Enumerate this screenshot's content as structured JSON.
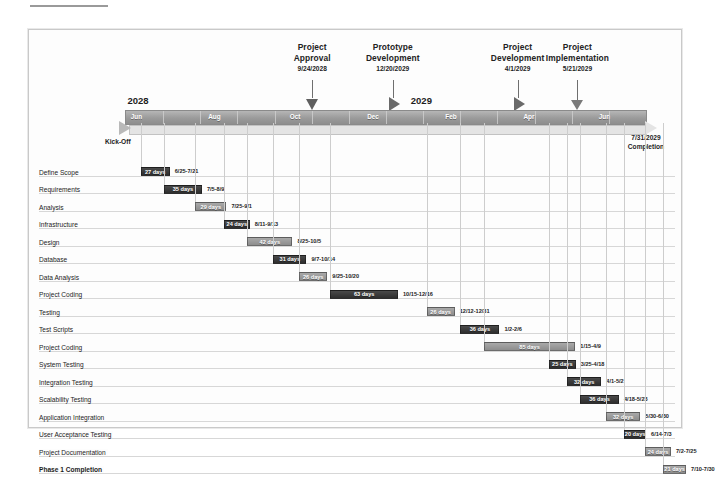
{
  "chart_data": {
    "type": "bar",
    "xlabel": "",
    "ylabel": "",
    "years": [
      {
        "label": "2028",
        "x_pct": 2.0
      },
      {
        "label": "2029",
        "x_pct": 56.5
      }
    ],
    "axis_months": [
      "Jun",
      "Aug",
      "Oct",
      "Dec",
      "Feb",
      "Apr",
      "Jun"
    ],
    "axis_month_positions": [
      2.0,
      17.0,
      32.5,
      47.5,
      62.5,
      77.5,
      92.0
    ],
    "kickoff_label": "Kick-Off",
    "completion": {
      "date": "7/31/2029",
      "label": "Completion"
    },
    "milestones": [
      {
        "title": "Project\nApproval",
        "title_line1": "Project",
        "title_line2": "Approval",
        "date": "9/24/2028",
        "marker": "triangle",
        "x_pct": 36.0
      },
      {
        "title": "Prototype\nDevelopment",
        "title_line1": "Prototype",
        "title_line2": "Development",
        "date": "12/20/2029",
        "marker": "chevron",
        "x_pct": 51.5
      },
      {
        "title": "Project\nDevelopment",
        "title_line1": "Project",
        "title_line2": "Development",
        "date": "4/1/2029",
        "marker": "chevron",
        "x_pct": 75.5
      },
      {
        "title": "Project\nImplementation",
        "title_line1": "Project",
        "title_line2": "Implementation",
        "date": "5/21/2029",
        "marker": "arrow",
        "x_pct": 87.0
      }
    ],
    "categories": [
      "Define Scope",
      "Requirements",
      "Analysis",
      "Infrastructure",
      "Design",
      "Database",
      "Data Analysis",
      "Project Coding",
      "Testing",
      "Test Scripts",
      "Project Coding",
      "System Testing",
      "Integration Testing",
      "Scalability Testing",
      "Application Integration",
      "User Acceptance Testing",
      "Project Documentation",
      "Phase 1 Completion"
    ],
    "values": [
      27,
      35,
      29,
      24,
      42,
      31,
      26,
      63,
      26,
      36,
      85,
      25,
      32,
      36,
      32,
      20,
      24,
      21
    ],
    "tasks": [
      {
        "name": "Define Scope",
        "duration": "27 days",
        "dates": "6/25-7/21",
        "start_pct": 3.0,
        "width_pct": 5.6,
        "color": "dark",
        "bold": false
      },
      {
        "name": "Requirements",
        "duration": "35 days",
        "dates": "7/5-8/9",
        "start_pct": 7.5,
        "width_pct": 7.3,
        "color": "dark",
        "bold": false
      },
      {
        "name": "Analysis",
        "duration": "29 days",
        "dates": "7/25-9/1",
        "start_pct": 13.5,
        "width_pct": 6.0,
        "color": "gray",
        "bold": false
      },
      {
        "name": "Infrastructure",
        "duration": "24 days",
        "dates": "8/11-9/13",
        "start_pct": 19.0,
        "width_pct": 5.0,
        "color": "dark",
        "bold": false
      },
      {
        "name": "Design",
        "duration": "42 days",
        "dates": "8/25-10/5",
        "start_pct": 23.5,
        "width_pct": 8.7,
        "color": "gray",
        "bold": false
      },
      {
        "name": "Database",
        "duration": "31 days",
        "dates": "9/7-10/14",
        "start_pct": 28.5,
        "width_pct": 6.4,
        "color": "dark",
        "bold": false
      },
      {
        "name": "Data Analysis",
        "duration": "26 days",
        "dates": "9/25-10/20",
        "start_pct": 33.5,
        "width_pct": 5.4,
        "color": "gray",
        "bold": false
      },
      {
        "name": "Project Coding",
        "duration": "63 days",
        "dates": "10/15-12/16",
        "start_pct": 39.5,
        "width_pct": 13.0,
        "color": "dark",
        "bold": false
      },
      {
        "name": "Testing",
        "duration": "26 days",
        "dates": "12/12-12/31",
        "start_pct": 58.0,
        "width_pct": 5.4,
        "color": "gray",
        "bold": false
      },
      {
        "name": "Test Scripts",
        "duration": "36 days",
        "dates": "1/2-2/6",
        "start_pct": 64.5,
        "width_pct": 7.5,
        "color": "dark",
        "bold": false
      },
      {
        "name": "Project Coding",
        "duration": "85 days",
        "dates": "1/15-4/9",
        "start_pct": 69.0,
        "width_pct": 17.6,
        "color": "gray",
        "bold": false
      },
      {
        "name": "System Testing",
        "duration": "25 days",
        "dates": "3/25-4/18",
        "start_pct": 81.5,
        "width_pct": 5.2,
        "color": "dark",
        "bold": false
      },
      {
        "name": "Integration Testing",
        "duration": "32 days",
        "dates": "4/1-5/2",
        "start_pct": 85.0,
        "width_pct": 6.6,
        "color": "dark",
        "bold": false
      },
      {
        "name": "Scalability Testing",
        "duration": "36 days",
        "dates": "4/18-5/23",
        "start_pct": 87.5,
        "width_pct": 7.5,
        "color": "dark",
        "bold": false
      },
      {
        "name": "Application Integration",
        "duration": "32 days",
        "dates": "5/30-6/30",
        "start_pct": 92.5,
        "width_pct": 6.6,
        "color": "gray",
        "bold": false
      },
      {
        "name": "User Acceptance Testing",
        "duration": "20 days",
        "dates": "6/14-7/3",
        "start_pct": 96.0,
        "width_pct": 4.2,
        "color": "dark",
        "bold": false
      },
      {
        "name": "Project Documentation",
        "duration": "24 days",
        "dates": "7/2-7/25",
        "start_pct": 100.0,
        "width_pct": 5.0,
        "color": "gray",
        "bold": false
      },
      {
        "name": "Phase 1 Completion",
        "duration": "21 days",
        "dates": "7/10-7/30",
        "start_pct": 103.5,
        "width_pct": 4.4,
        "color": "gray",
        "bold": true
      }
    ],
    "colors": {
      "bar_dark": "#333333",
      "bar_gray": "#969696",
      "axis": "#9a9a9a",
      "grid": "#d7d7d7",
      "frame": "#c9c9c9",
      "text": "#1c1c1c"
    },
    "grid": true,
    "legend": "none"
  }
}
